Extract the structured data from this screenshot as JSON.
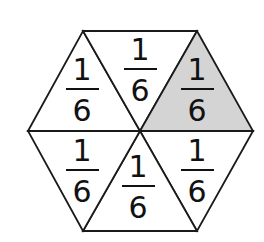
{
  "diagram": {
    "colors": {
      "stroke": "#1a1a1a",
      "fill": "#ffffff",
      "shaded_fill": "#d4d4d4",
      "text": "#111111"
    },
    "center": [
      140,
      131
    ],
    "vertices": {
      "top_left": [
        83,
        31
      ],
      "top_right": [
        197,
        31
      ],
      "right": [
        253,
        131
      ],
      "bottom_right": [
        197,
        231
      ],
      "bottom_left": [
        83,
        231
      ],
      "left": [
        28,
        131
      ]
    },
    "triangles": [
      {
        "id": "top-left",
        "numerator": "1",
        "denominator": "6",
        "shaded": false,
        "label_center": [
          82,
          89
        ]
      },
      {
        "id": "top-middle",
        "numerator": "1",
        "denominator": "6",
        "shaded": false,
        "label_center": [
          140,
          69
        ]
      },
      {
        "id": "top-right",
        "numerator": "1",
        "denominator": "6",
        "shaded": true,
        "label_center": [
          197,
          89
        ]
      },
      {
        "id": "bottom-left",
        "numerator": "1",
        "denominator": "6",
        "shaded": false,
        "label_center": [
          82,
          170
        ]
      },
      {
        "id": "bottom-middle",
        "numerator": "1",
        "denominator": "6",
        "shaded": false,
        "label_center": [
          138,
          186
        ]
      },
      {
        "id": "bottom-right",
        "numerator": "1",
        "denominator": "6",
        "shaded": false,
        "label_center": [
          197,
          170
        ]
      }
    ]
  }
}
